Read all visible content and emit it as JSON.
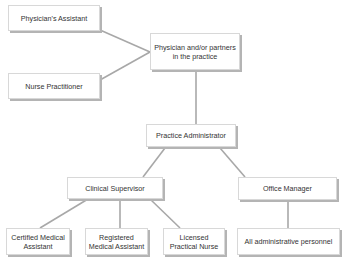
{
  "diagram": {
    "type": "org-chart",
    "nodes": {
      "physicians_assistant": "Physician's Assistant",
      "nurse_practitioner": "Nurse Practitioner",
      "physician": "Physician and/or partners in the practice",
      "practice_administrator": "Practice Administrator",
      "clinical_supervisor": "Clinical Supervisor",
      "office_manager": "Office Manager",
      "certified_medical_assistant": "Certified Medical Assistant",
      "registered_medical_assistant": "Registered Medical Assistant",
      "licensed_practical_nurse": "Licensed Practical Nurse",
      "all_admin_personnel": "All administrative personnel"
    },
    "edges": [
      [
        "physicians_assistant",
        "physician"
      ],
      [
        "nurse_practitioner",
        "physician"
      ],
      [
        "physician",
        "practice_administrator"
      ],
      [
        "practice_administrator",
        "clinical_supervisor"
      ],
      [
        "practice_administrator",
        "office_manager"
      ],
      [
        "clinical_supervisor",
        "certified_medical_assistant"
      ],
      [
        "clinical_supervisor",
        "registered_medical_assistant"
      ],
      [
        "clinical_supervisor",
        "licensed_practical_nurse"
      ],
      [
        "office_manager",
        "all_admin_personnel"
      ]
    ],
    "colors": {
      "line": "#a8a8a8",
      "border": "#d8d8d8",
      "shadow": "#b4b4b4",
      "text": "#333333"
    }
  }
}
